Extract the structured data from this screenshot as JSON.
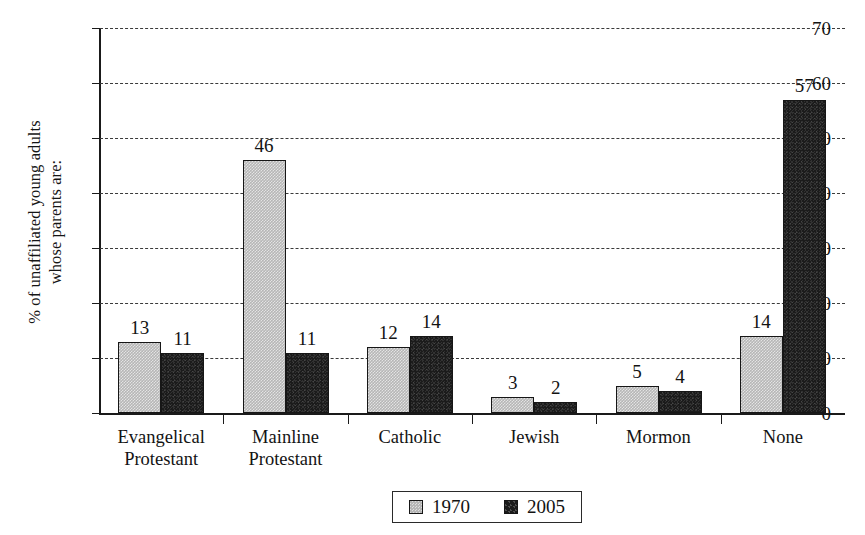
{
  "chart_data": {
    "type": "bar",
    "title": "",
    "xlabel": "",
    "ylabel_lines": [
      "% of unaffiliated young adults",
      "whose parents are:"
    ],
    "ylim": [
      0,
      70
    ],
    "ytick_labels": [
      "0",
      "10",
      "20",
      "30",
      "40",
      "50",
      "60",
      "70"
    ],
    "ytick_values": [
      0,
      10,
      20,
      30,
      40,
      50,
      60,
      70
    ],
    "grid": "horizontal-dashed",
    "legend_position": "bottom-center",
    "categories": [
      "Evangelical Protestant",
      "Mainline Protestant",
      "Catholic",
      "Jewish",
      "Mormon",
      "None"
    ],
    "category_label_lines": [
      [
        "Evangelical",
        "Protestant"
      ],
      [
        "Mainline",
        "Protestant"
      ],
      [
        "Catholic"
      ],
      [
        "Jewish"
      ],
      [
        "Mormon"
      ],
      [
        "None"
      ]
    ],
    "series": [
      {
        "name": "1970",
        "color": "#b6b6b6",
        "values": [
          13,
          46,
          12,
          3,
          5,
          14
        ]
      },
      {
        "name": "2005",
        "color": "#1b1b1b",
        "values": [
          11,
          11,
          14,
          2,
          4,
          57
        ]
      }
    ]
  },
  "legend": {
    "items": [
      {
        "label": "1970",
        "key": "s1970"
      },
      {
        "label": "2005",
        "key": "s2005"
      }
    ]
  }
}
